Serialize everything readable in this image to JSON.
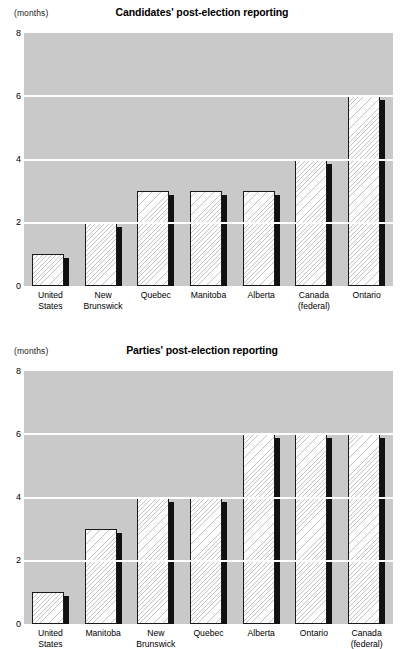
{
  "page": {
    "background_color": "#ffffff",
    "plot_background_color": "#c9c9c9",
    "gridline_color": "#ffffff",
    "bar_fill_color": "#fdfdfd",
    "bar_border_color": "#1a1a1a",
    "bar_shadow_color": "#111111"
  },
  "charts": [
    {
      "units_label": "(months)",
      "title": "Candidates' post-election reporting",
      "ytick_labels": [
        "8",
        "6",
        "4",
        "2",
        "0"
      ]
    },
    {
      "units_label": "(months)",
      "title": "Parties' post-election reporting",
      "ytick_labels": [
        "8",
        "6",
        "4",
        "2",
        "0"
      ]
    }
  ],
  "chart_data": [
    {
      "type": "bar",
      "title": "Candidates' post-election reporting",
      "xlabel": "",
      "ylabel": "(months)",
      "ylim": [
        0,
        8
      ],
      "yticks": [
        0,
        2,
        4,
        6,
        8
      ],
      "grid": true,
      "legend": "none",
      "categories": [
        "United States",
        "New Brunswick",
        "Quebec",
        "Manitoba",
        "Alberta",
        "Canada (federal)",
        "Ontario"
      ],
      "values": [
        1,
        2,
        3,
        3,
        3,
        4,
        6
      ]
    },
    {
      "type": "bar",
      "title": "Parties' post-election reporting",
      "xlabel": "",
      "ylabel": "(months)",
      "ylim": [
        0,
        8
      ],
      "yticks": [
        0,
        2,
        4,
        6,
        8
      ],
      "grid": true,
      "legend": "none",
      "categories": [
        "United States",
        "Manitoba",
        "New Brunswick",
        "Quebec",
        "Alberta",
        "Ontario",
        "Canada (federal)"
      ],
      "values": [
        1,
        3,
        4,
        4,
        6,
        6,
        6
      ]
    }
  ]
}
